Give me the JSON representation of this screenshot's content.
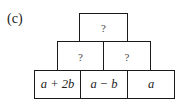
{
  "diagram": {
    "label": "(c)",
    "rows": [
      {
        "row": "top",
        "cells": [
          "?"
        ]
      },
      {
        "row": "middle",
        "cells": [
          "?",
          "?"
        ]
      },
      {
        "row": "bottom",
        "cells": [
          "a + 2b",
          "a − b",
          "a"
        ]
      }
    ],
    "line_color": "#1a1a1a"
  }
}
